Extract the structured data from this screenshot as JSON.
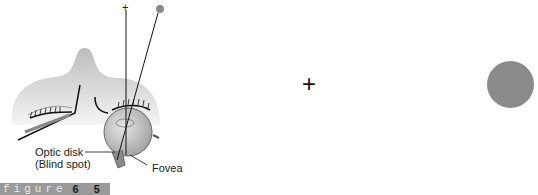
{
  "figure": {
    "word": "figure",
    "number": "6 5",
    "labels": {
      "optic_disk_line1": "Optic disk",
      "optic_disk_line2": "(Blind spot)",
      "fovea": "Fovea"
    },
    "target_plus": "+",
    "colors": {
      "dot": "#8a8a8a",
      "face": "#c8c8c8",
      "bar": "#9a9a9a"
    }
  }
}
